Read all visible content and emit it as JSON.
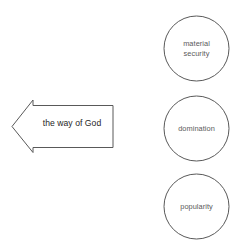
{
  "diagram": {
    "background_color": "#ffffff",
    "stroke_color": "#595959",
    "arrow_text_color": "#262626",
    "circle_text_color": "#5a5a5a",
    "arrow": {
      "name": "the-way-of-god-arrow",
      "label": "the way of God",
      "direction": "left",
      "fill": "#ffffff"
    },
    "circles": [
      {
        "name": "material-security",
        "label": "material\nsecurity",
        "cx": 196.5,
        "cy": 48.5,
        "r": 32.5
      },
      {
        "name": "domination",
        "label": "domination",
        "cx": 196.5,
        "cy": 128.5,
        "r": 32.5
      },
      {
        "name": "popularity",
        "label": "popularity",
        "cx": 196.5,
        "cy": 206.5,
        "r": 32.5
      }
    ]
  }
}
